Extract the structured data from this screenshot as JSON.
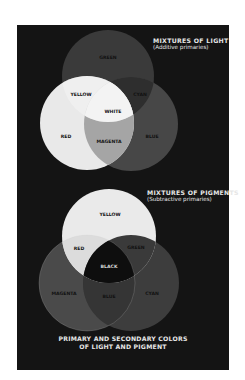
{
  "colors": {
    "page_background": "#ffffff",
    "panel_background": "#141414",
    "heading_text": "#e6e6e6"
  },
  "light": {
    "title": "MIXTURES OF LIGHT",
    "subtitle": "(Additive primaries)",
    "circles": [
      {
        "name": "GREEN",
        "fill": "#3a3a3a"
      },
      {
        "name": "RED",
        "fill": "#e9e9e9"
      },
      {
        "name": "BLUE",
        "fill": "#474747"
      }
    ],
    "labels": {
      "green": "GREEN",
      "yellow": "YELLOW",
      "cyan": "CYAN",
      "white": "WHITE",
      "red": "RED",
      "magenta": "MAGENTA",
      "blue": "BLUE"
    }
  },
  "pigment": {
    "title": "MIXTURES OF PIGMENTS",
    "subtitle": "(Subtractive primaries)",
    "circles": [
      {
        "name": "YELLOW",
        "fill": "#eaeaea"
      },
      {
        "name": "MAGENTA",
        "fill": "#4a4a4a"
      },
      {
        "name": "CYAN",
        "fill": "#3d3d3d"
      }
    ],
    "labels": {
      "yellow": "YELLOW",
      "red": "RED",
      "green": "GREEN",
      "black": "BLACK",
      "magenta": "MAGENTA",
      "blue": "BLUE",
      "cyan": "CYAN"
    }
  },
  "caption": {
    "line1": "PRIMARY AND SECONDARY COLORS",
    "line2": "OF LIGHT AND PIGMENT"
  }
}
